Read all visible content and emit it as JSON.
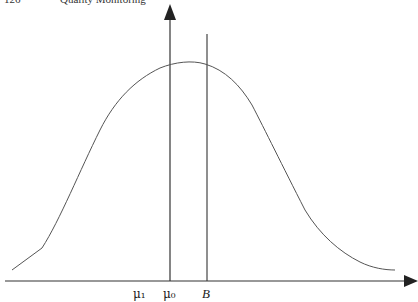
{
  "header": {
    "page_number": "126",
    "running_title": "Quality Monitoring"
  },
  "figure": {
    "type": "normal density curve with reference lines",
    "axes": {
      "x_axis_arrow": true,
      "y_axis_arrow": true
    },
    "labels": {
      "mu1": "μ₁",
      "mu0": "μ₀",
      "boundary": "B"
    },
    "colors": {
      "line": "#333333",
      "curve": "#555555"
    }
  }
}
